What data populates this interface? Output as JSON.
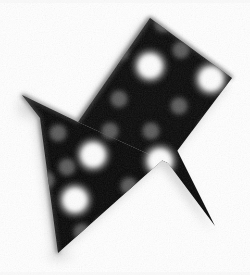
{
  "image": {
    "title": "Illuminated arrow sign pointing down-left",
    "medium": "halftone black-and-white photograph",
    "width": 250,
    "height": 275,
    "background_color": "#ffffff",
    "sign_color": "#070707",
    "sign_edge_color": "#3a3a3a",
    "shadow_color": "#b9b9b9",
    "bulb_bright_color": "#fdfdfd",
    "bulb_dim_color": "#5a5a5a",
    "bulb_mid_color": "#9a9a9a",
    "direction": "down-left",
    "caption": "Arrow-shaped marquee sign with round light bulbs"
  },
  "geometry": {
    "shaft_points": "150,18 232,78 168,163 78,122",
    "head_points": "22,95 78,122 168,163 215,226 176,148 58,253 40,118",
    "notch_vertex": [
      78,
      122
    ],
    "arrow_tip": [
      58,
      253
    ],
    "right_barb_tip": [
      215,
      226
    ],
    "left_barb_tip": [
      22,
      95
    ],
    "top_vertex": [
      150,
      18
    ],
    "right_vertex": [
      232,
      78
    ]
  },
  "bulbs": {
    "bright_radius": 11,
    "dim_radius": 7,
    "shaft": [
      {
        "x": 150,
        "y": 66,
        "kind": "bright"
      },
      {
        "x": 120,
        "y": 52,
        "kind": "dim"
      },
      {
        "x": 181,
        "y": 50,
        "kind": "dim"
      },
      {
        "x": 211,
        "y": 79,
        "kind": "bright"
      },
      {
        "x": 119,
        "y": 99,
        "kind": "dim"
      },
      {
        "x": 179,
        "y": 106,
        "kind": "dim"
      },
      {
        "x": 151,
        "y": 131,
        "kind": "dim"
      },
      {
        "x": 207,
        "y": 127,
        "kind": "dim"
      },
      {
        "x": 163,
        "y": 24,
        "kind": "dim"
      }
    ],
    "head": [
      {
        "x": 58,
        "y": 133,
        "kind": "dim"
      },
      {
        "x": 93,
        "y": 155,
        "kind": "bright"
      },
      {
        "x": 67,
        "y": 167,
        "kind": "dim"
      },
      {
        "x": 110,
        "y": 131,
        "kind": "dim"
      },
      {
        "x": 160,
        "y": 161,
        "kind": "bright"
      },
      {
        "x": 129,
        "y": 186,
        "kind": "dim"
      },
      {
        "x": 75,
        "y": 200,
        "kind": "bright"
      },
      {
        "x": 104,
        "y": 225,
        "kind": "dim"
      },
      {
        "x": 144,
        "y": 219,
        "kind": "bright"
      },
      {
        "x": 82,
        "y": 232,
        "kind": "dim"
      },
      {
        "x": 174,
        "y": 198,
        "kind": "dim"
      },
      {
        "x": 171,
        "y": 226,
        "kind": "dim"
      },
      {
        "x": 116,
        "y": 243,
        "kind": "dim"
      },
      {
        "x": 46,
        "y": 180,
        "kind": "dim"
      }
    ]
  }
}
